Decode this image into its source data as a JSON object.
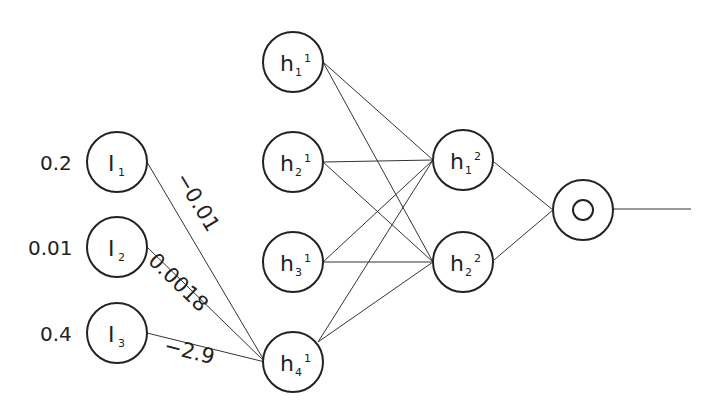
{
  "diagram": {
    "type": "neural-network",
    "inputs": [
      {
        "id": "I1",
        "label": "I",
        "sub": "1",
        "value": "0.2"
      },
      {
        "id": "I2",
        "label": "I",
        "sub": "2",
        "value": "0.01"
      },
      {
        "id": "I3",
        "label": "I",
        "sub": "3",
        "value": "0.4"
      }
    ],
    "hidden1": [
      {
        "label": "h",
        "sub": "1",
        "sup": "1"
      },
      {
        "label": "h",
        "sub": "2",
        "sup": "1"
      },
      {
        "label": "h",
        "sub": "3",
        "sup": "1"
      },
      {
        "label": "h",
        "sub": "4",
        "sup": "1"
      }
    ],
    "hidden2": [
      {
        "label": "h",
        "sub": "1",
        "sup": "2"
      },
      {
        "label": "h",
        "sub": "2",
        "sup": "2"
      }
    ],
    "output": {
      "label": "O"
    },
    "weights": {
      "I1_h4": "−0.01",
      "I2_h4": "0.0018",
      "I3_h4": "−2.9"
    }
  }
}
